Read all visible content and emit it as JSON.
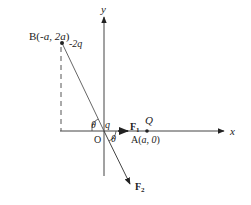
{
  "diagram": {
    "axes": {
      "x_label": "x",
      "y_label": "y"
    },
    "point_B": {
      "label_prefix": "B(",
      "coord_x": "-a",
      "sep": ", ",
      "coord_y": "2a",
      "label_suffix": ")",
      "charge": "-2q"
    },
    "origin": {
      "label": "O",
      "charge": "q"
    },
    "point_A": {
      "label_prefix": "A(",
      "coord_x": "a",
      "sep": ", ",
      "coord_y": "0",
      "label_suffix": ")",
      "charge": "Q"
    },
    "angle_label": "θ",
    "force_1": {
      "base": "F",
      "sub": "1"
    },
    "force_2": {
      "base": "F",
      "sub": "2"
    },
    "colors": {
      "line": "#333333",
      "dashed": "#555555"
    }
  }
}
